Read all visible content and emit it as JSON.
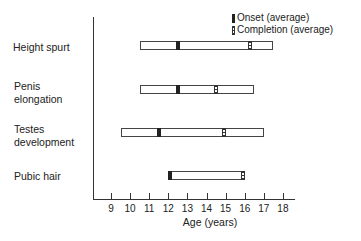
{
  "chart_data": {
    "type": "gantt-range",
    "title": "",
    "xlabel": "Age (years)",
    "ylabel": "",
    "xlim": [
      8,
      18.5
    ],
    "x_ticks": [
      9,
      10,
      11,
      12,
      13,
      14,
      15,
      16,
      17,
      18
    ],
    "grid": false,
    "legend": {
      "position": "top-right",
      "entries": [
        {
          "name": "Onset (average)",
          "style": "solid-black"
        },
        {
          "name": "Completion (average)",
          "style": "hatched"
        }
      ]
    },
    "categories": [
      "Height spurt",
      "Penis elongation",
      "Testes development",
      "Pubic hair"
    ],
    "series": [
      {
        "name": "Height spurt",
        "range": [
          10.5,
          17.5
        ],
        "onset": 12.5,
        "completion": 16.3
      },
      {
        "name": "Penis elongation",
        "range": [
          10.5,
          16.5
        ],
        "onset": 12.5,
        "completion": 14.5
      },
      {
        "name": "Testes development",
        "range": [
          9.5,
          17
        ],
        "onset": 11.5,
        "completion": 14.9
      },
      {
        "name": "Pubic hair",
        "range": [
          12,
          16
        ],
        "onset": 12.1,
        "completion": 15.9
      }
    ]
  },
  "labels": {
    "rows": [
      "Height spurt",
      "Penis\nelongation",
      "Testes\ndevelopment",
      "Pubic hair"
    ],
    "xlabel": "Age (years)",
    "legend_onset": "Onset (average)",
    "legend_completion": "Completion (average)",
    "ticks": [
      "9",
      "10",
      "11",
      "12",
      "13",
      "14",
      "15",
      "16",
      "17",
      "18"
    ]
  }
}
